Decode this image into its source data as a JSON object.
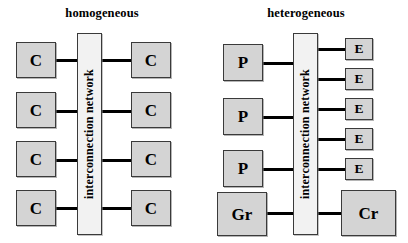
{
  "figure": {
    "kind": "architecture-diagram",
    "panels": [
      {
        "id": "homogeneous",
        "title": "homogeneous",
        "network": {
          "label": "interconnection network"
        },
        "left_nodes": [
          {
            "label": "C"
          },
          {
            "label": "C"
          },
          {
            "label": "C"
          },
          {
            "label": "C"
          }
        ],
        "right_nodes": [
          {
            "label": "C"
          },
          {
            "label": "C"
          },
          {
            "label": "C"
          },
          {
            "label": "C"
          }
        ]
      },
      {
        "id": "heterogeneous",
        "title": "heterogeneous",
        "network": {
          "label": "interconnection network"
        },
        "left_nodes": [
          {
            "label": "P"
          },
          {
            "label": "P"
          },
          {
            "label": "P"
          },
          {
            "label": "Gr"
          }
        ],
        "right_nodes": [
          {
            "label": "E"
          },
          {
            "label": "E"
          },
          {
            "label": "E"
          },
          {
            "label": "E"
          },
          {
            "label": "E"
          },
          {
            "label": "Cr"
          }
        ]
      }
    ],
    "colors": {
      "node_fill": "#d4d4d4",
      "network_fill": "#f2f2f2",
      "stroke": "#3a3a3a",
      "link": "#000000",
      "background": "#ffffff",
      "text": "#000000"
    }
  }
}
